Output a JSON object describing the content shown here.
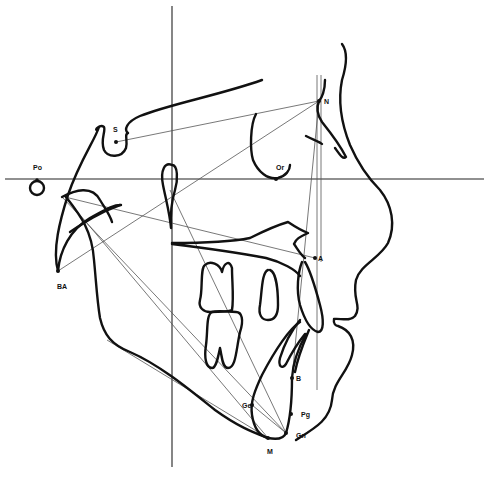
{
  "diagram": {
    "type": "cephalometric-tracing",
    "colors": {
      "line": "#111111",
      "reference": "#555555",
      "background": "#ffffff"
    },
    "landmarks": [
      {
        "id": "S",
        "label": "S",
        "x": 116,
        "y": 142,
        "lx": 113,
        "ly": 132
      },
      {
        "id": "N",
        "label": "N",
        "x": 319,
        "y": 101,
        "lx": 324,
        "ly": 104
      },
      {
        "id": "Po",
        "label": "Po",
        "x": 37,
        "y": 180,
        "lx": 33,
        "ly": 170
      },
      {
        "id": "Or",
        "label": "Or",
        "x": 276,
        "y": 179,
        "lx": 276,
        "ly": 170
      },
      {
        "id": "BA",
        "label": "BA",
        "x": 58,
        "y": 271,
        "lx": 57,
        "ly": 289
      },
      {
        "id": "A",
        "label": "A",
        "x": 315,
        "y": 258,
        "lx": 318,
        "ly": 261
      },
      {
        "id": "B",
        "label": "B",
        "x": 292,
        "y": 378,
        "lx": 296,
        "ly": 381
      },
      {
        "id": "Pg",
        "label": "Pg",
        "x": 291,
        "y": 414,
        "lx": 301,
        "ly": 417
      },
      {
        "id": "Gn",
        "label": "Gn",
        "x": 286,
        "y": 433,
        "lx": 296,
        "ly": 438
      },
      {
        "id": "Me",
        "label": "M",
        "x": 268,
        "y": 438,
        "lx": 267,
        "ly": 454
      },
      {
        "id": "Go",
        "label": "Ge",
        "x": 252,
        "y": 405,
        "lx": 242,
        "ly": 408
      }
    ],
    "reference_lines": {
      "frankfort_horizontal_y": 179,
      "vertical_x": 172
    }
  }
}
